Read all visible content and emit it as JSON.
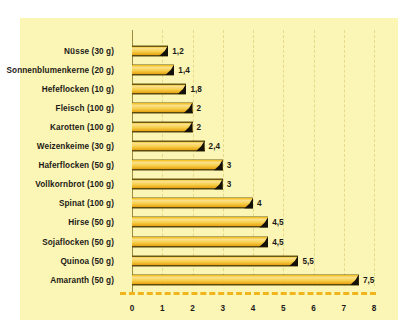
{
  "chart_data": {
    "type": "bar",
    "orientation": "horizontal",
    "title": "",
    "subtitle": "",
    "xlabel": "",
    "ylabel": "",
    "xlim": [
      0,
      8
    ],
    "xticks": [
      "0",
      "1",
      "2",
      "3",
      "4",
      "5",
      "6",
      "7",
      "8"
    ],
    "grid": true,
    "grid_axis": "x",
    "legend": false,
    "decimal_separator": ",",
    "categories": [
      "Nüsse (30 g)",
      "Sonnenblumenkerne (20 g)",
      "Hefeflocken (10 g)",
      "Fleisch (100 g)",
      "Karotten (100 g)",
      "Weizenkeime (30 g)",
      "Haferflocken (50 g)",
      "Vollkornbrot (100 g)",
      "Spinat (100 g)",
      "Hirse (50 g)",
      "Sojaflocken (50 g)",
      "Quinoa (50 g)",
      "Amaranth (50 g)"
    ],
    "values": [
      1.2,
      1.4,
      1.8,
      2,
      2,
      2.4,
      3,
      3,
      4,
      4.5,
      4.5,
      5.5,
      7.5
    ],
    "value_labels": [
      "1,2",
      "1,4",
      "1,8",
      "2",
      "2",
      "2,4",
      "3",
      "3",
      "4",
      "4,5",
      "4,5",
      "5,5",
      "7,5"
    ],
    "colors": {
      "panel_background": "#fbf6b6",
      "page_background": "#ffffff",
      "bar_fill_light": "#fbe08a",
      "bar_fill_mid": "#f7cf4b",
      "bar_fill_dark": "#e8a81a",
      "bar_outline": "#5c4a0e",
      "bar_cap": "#14100a",
      "axis_line": "#9b8c3e",
      "gridline": "#e6d98a",
      "baseline_dash": "#f0b51d",
      "text": "#1d1b16"
    }
  }
}
